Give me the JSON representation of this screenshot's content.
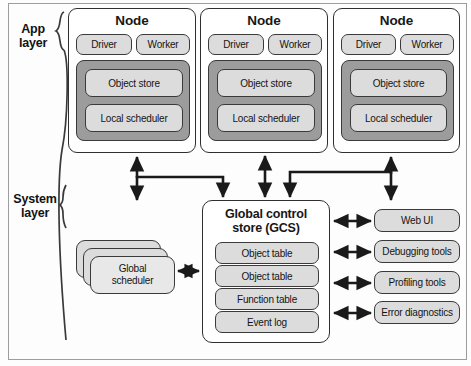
{
  "layers": [
    {
      "id": "app",
      "label_line1": "App",
      "label_line2": "layer"
    },
    {
      "id": "system",
      "label_line1": "System",
      "label_line2": "layer"
    }
  ],
  "nodes": [
    {
      "title": "Node",
      "driver": "Driver",
      "worker": "Worker",
      "object_store": "Object store",
      "local_scheduler": "Local scheduler"
    },
    {
      "title": "Node",
      "driver": "Driver",
      "worker": "Worker",
      "object_store": "Object store",
      "local_scheduler": "Local scheduler"
    },
    {
      "title": "Node",
      "driver": "Driver",
      "worker": "Worker",
      "object_store": "Object store",
      "local_scheduler": "Local scheduler"
    }
  ],
  "gcs": {
    "title_line1": "Global control",
    "title_line2": "store (GCS)",
    "rows": [
      "Object table",
      "Object table",
      "Function table",
      "Event log"
    ]
  },
  "global_scheduler": {
    "label_line1": "Global",
    "label_line2": "scheduler",
    "stack_count": 3
  },
  "tools": [
    "Web UI",
    "Debugging tools",
    "Profiling tools",
    "Error diagnostics"
  ],
  "colors": {
    "background": "#fdfdfd",
    "box_border": "#2f2f2f",
    "pill_fill": "#dcdcdc",
    "pill_border": "#3a3a3a",
    "dark_panel_fill": "#9c9c9c",
    "arrow": "#1a1a1a",
    "frame_border": "#9d9d9d",
    "text": "#141414"
  }
}
